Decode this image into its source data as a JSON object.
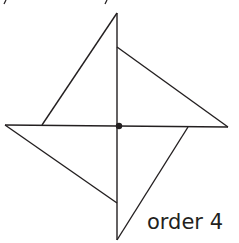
{
  "figure": {
    "caption": "order 4",
    "stroke_color": "#231f20",
    "center": {
      "x": 119,
      "y": 126
    },
    "vertices": {
      "top": {
        "x": 117,
        "y": 13
      },
      "right": {
        "x": 228,
        "y": 127
      },
      "bottom": {
        "x": 117,
        "y": 240
      },
      "left": {
        "x": 5,
        "y": 125
      }
    },
    "inner_points": {
      "top_right": {
        "x": 117,
        "y": 47
      },
      "left_upper": {
        "x": 42,
        "y": 125
      },
      "right_lower": {
        "x": 188,
        "y": 127
      },
      "bottom_left": {
        "x": 117,
        "y": 203
      }
    }
  }
}
